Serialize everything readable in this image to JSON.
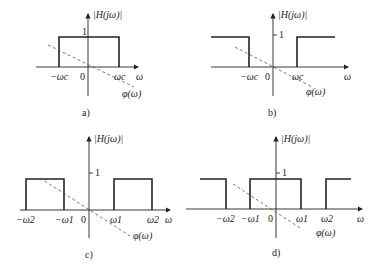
{
  "panels": {
    "a": {
      "caption": "a)",
      "y_label": "|H(jω)|",
      "x_label": "ω",
      "one_label": "1",
      "zero_label": "0",
      "phase_label": "φ(ω)",
      "ticks": [
        "−ωc",
        "ωc"
      ],
      "type": "low-pass"
    },
    "b": {
      "caption": "b)",
      "y_label": "|H(jω)|",
      "x_label": "ω",
      "one_label": "1",
      "zero_label": "0",
      "phase_label": "φ(ω)",
      "ticks": [
        "−ωc",
        "ωc"
      ],
      "type": "high-pass"
    },
    "c": {
      "caption": "c)",
      "y_label": "|H(jω)|",
      "x_label": "ω",
      "one_label": "1",
      "zero_label": "0",
      "phase_label": "φ(ω)",
      "ticks": [
        "−ω2",
        "−ω1",
        "ω1",
        "ω2"
      ],
      "type": "band-pass"
    },
    "d": {
      "caption": "d)",
      "y_label": "|H(jω)|",
      "x_label": "ω",
      "one_label": "1",
      "zero_label": "0",
      "phase_label": "φ(ω)",
      "ticks": [
        "−ω2",
        "−ω1",
        "ω1",
        "ω2"
      ],
      "type": "band-stop"
    }
  }
}
